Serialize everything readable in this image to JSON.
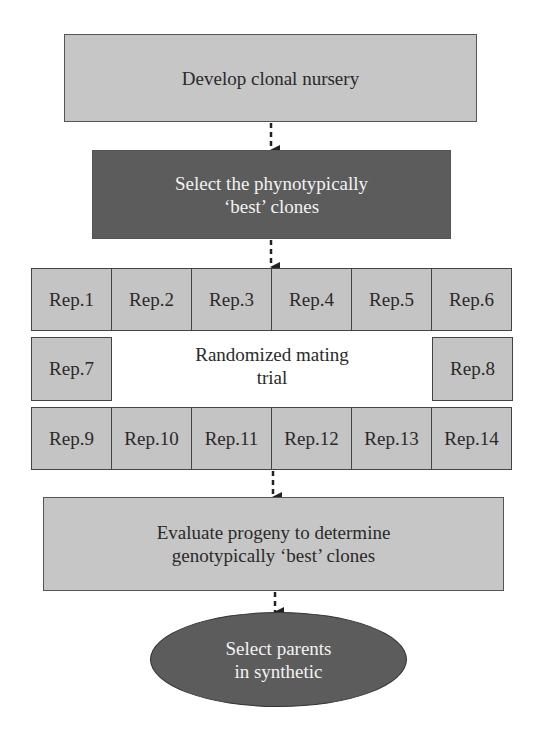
{
  "steps": {
    "develop": "Develop clonal nursery",
    "select_pheno_line1": "Select the phynotypically",
    "select_pheno_line2": "‘best’ clones",
    "mating_line1": "Randomized mating",
    "mating_line2": "trial",
    "evaluate_line1": "Evaluate progeny to determine",
    "evaluate_line2": "genotypically ‘best’ clones",
    "final_line1": "Select parents",
    "final_line2": "in synthetic"
  },
  "reps": {
    "top_row": [
      "Rep.1",
      "Rep.2",
      "Rep.3",
      "Rep.4",
      "Rep.5",
      "Rep.6"
    ],
    "middle_left": "Rep.7",
    "middle_right": "Rep.8",
    "bottom_row": [
      "Rep.9",
      "Rep.10",
      "Rep.11",
      "Rep.12",
      "Rep.13",
      "Rep.14"
    ]
  },
  "colors": {
    "light_fill": "#c6c6c6",
    "dark_fill": "#5c5c5c",
    "border": "#444444"
  }
}
